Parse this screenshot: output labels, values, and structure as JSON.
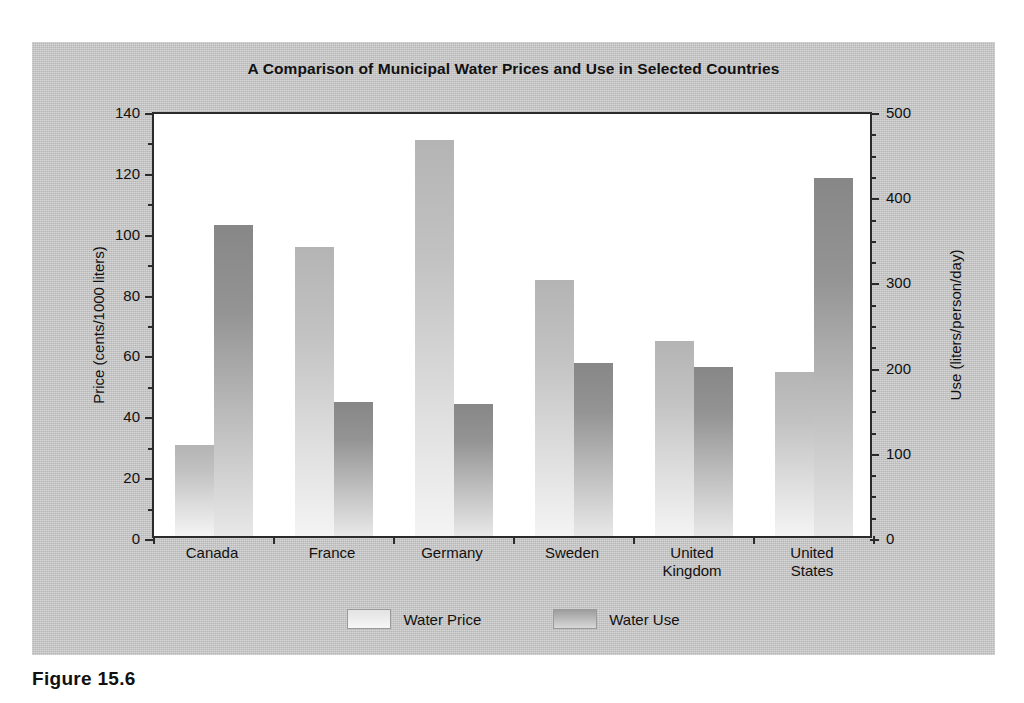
{
  "figure": {
    "caption": "Figure 15.6"
  },
  "chart_data": {
    "type": "bar",
    "title": "A Comparison of Municipal Water Prices and Use in Selected Countries",
    "xlabel": "",
    "categories": [
      "Canada",
      "France",
      "Germany",
      "Sweden",
      "United Kingdom",
      "United States"
    ],
    "category_lines": [
      [
        "Canada"
      ],
      [
        "France"
      ],
      [
        "Germany"
      ],
      [
        "Sweden"
      ],
      [
        "United",
        "Kingdom"
      ],
      [
        "United",
        "States"
      ]
    ],
    "series": [
      {
        "name": "Water Price",
        "axis": "left",
        "unit": "cents/1000 liters",
        "values": [
          30,
          95,
          130,
          84,
          64,
          54
        ],
        "color": "#c6c6c6"
      },
      {
        "name": "Water Use",
        "axis": "right",
        "unit": "liters/person/day",
        "values": [
          365,
          157,
          155,
          203,
          198,
          420
        ],
        "color": "#949494"
      }
    ],
    "left_axis": {
      "label": "Price (cents/1000 liters)",
      "min": 0,
      "max": 140,
      "major_step": 20,
      "minor_step": 10,
      "ticks": [
        0,
        20,
        40,
        60,
        80,
        100,
        120,
        140
      ]
    },
    "right_axis": {
      "label": "Use (liters/person/day)",
      "min": 0,
      "max": 500,
      "major_step": 100,
      "minor_step": 25,
      "ticks": [
        0,
        100,
        200,
        300,
        400,
        500
      ]
    },
    "legend": {
      "position": "bottom",
      "entries": [
        "Water Price",
        "Water Use"
      ]
    },
    "grid": false
  }
}
